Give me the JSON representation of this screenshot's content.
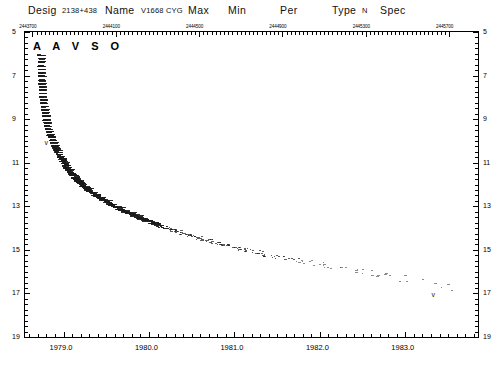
{
  "header": {
    "desig_label": "Desig",
    "desig_value": "2138+438",
    "name_label": "Name",
    "name_value": "V1668 CYG",
    "max_label": "Max",
    "max_value": "",
    "min_label": "Min",
    "min_value": "",
    "per_label": "Per",
    "per_value": "",
    "type_label": "Type",
    "type_value": "N",
    "spec_label": "Spec",
    "spec_value": ""
  },
  "watermark": "A A V S O",
  "chart_data": {
    "type": "scatter",
    "xlabel": "",
    "ylabel": "",
    "grid": false,
    "legend": null,
    "xlim": [
      1978.55,
      1983.85
    ],
    "ylim": [
      19,
      5
    ],
    "y_inverted": true,
    "x_top_axis": {
      "label": "Julian Date",
      "ticks": [
        2443700,
        2444100,
        2444500,
        2444900,
        2445300,
        2445700
      ],
      "tick_labels": [
        "2443700",
        "2444100",
        "2444500",
        "2444900",
        "2445300",
        "2445700"
      ],
      "minor_tick_step": 20
    },
    "x_bottom_axis": {
      "label": "Year",
      "ticks": [
        1979.0,
        1980.0,
        1981.0,
        1982.0,
        1983.0
      ],
      "tick_labels": [
        "1979.0",
        "1980.0",
        "1981.0",
        "1982.0",
        "1983.0"
      ],
      "minor_tick_step": 0.1
    },
    "y_left_axis": {
      "label": "Magnitude",
      "ticks": [
        5,
        7,
        9,
        11,
        13,
        15,
        17,
        19
      ],
      "tick_labels": [
        "5",
        "7",
        "9",
        "11",
        "13",
        "15",
        "17",
        "19"
      ],
      "minor_tick_step": 0.25
    },
    "y_right_axis": {
      "ticks": [
        5,
        7,
        9,
        11,
        13,
        15,
        17,
        19
      ],
      "tick_labels": [
        "5",
        "7",
        "9",
        "11",
        "13",
        "15",
        "17",
        "19"
      ]
    },
    "series": [
      {
        "name": "visual magnitude estimates",
        "marker": "dash",
        "color": "#1a1a1a",
        "points": [
          [
            1978.7,
            6.05
          ],
          [
            1978.702,
            6.2
          ],
          [
            1978.704,
            6.35
          ],
          [
            1978.703,
            6.55
          ],
          [
            1978.706,
            6.7
          ],
          [
            1978.708,
            6.85
          ],
          [
            1978.71,
            7.0
          ],
          [
            1978.712,
            7.2
          ],
          [
            1978.714,
            7.35
          ],
          [
            1978.716,
            7.5
          ],
          [
            1978.718,
            7.65
          ],
          [
            1978.722,
            7.8
          ],
          [
            1978.726,
            7.95
          ],
          [
            1978.73,
            8.1
          ],
          [
            1978.735,
            8.25
          ],
          [
            1978.74,
            8.4
          ],
          [
            1978.746,
            8.55
          ],
          [
            1978.752,
            8.7
          ],
          [
            1978.758,
            8.85
          ],
          [
            1978.764,
            9.0
          ],
          [
            1978.772,
            9.15
          ],
          [
            1978.78,
            9.3
          ],
          [
            1978.79,
            9.45
          ],
          [
            1978.8,
            9.55
          ],
          [
            1978.812,
            9.7
          ],
          [
            1978.824,
            9.8
          ],
          [
            1978.836,
            9.95
          ],
          [
            1978.85,
            10.05
          ],
          [
            1978.864,
            10.2
          ],
          [
            1978.878,
            10.3
          ],
          [
            1978.892,
            10.4
          ],
          [
            1978.906,
            10.5
          ],
          [
            1978.92,
            10.6
          ],
          [
            1978.935,
            10.7
          ],
          [
            1978.95,
            10.8
          ],
          [
            1978.965,
            10.9
          ],
          [
            1978.98,
            11.0
          ],
          [
            1978.995,
            11.1
          ],
          [
            1979.012,
            11.2
          ],
          [
            1979.03,
            11.3
          ],
          [
            1979.048,
            11.4
          ],
          [
            1979.066,
            11.5
          ],
          [
            1979.084,
            11.55
          ],
          [
            1979.102,
            11.65
          ],
          [
            1979.12,
            11.72
          ],
          [
            1979.14,
            11.8
          ],
          [
            1979.16,
            11.88
          ],
          [
            1979.18,
            11.95
          ],
          [
            1979.205,
            12.05
          ],
          [
            1979.23,
            12.12
          ],
          [
            1979.255,
            12.2
          ],
          [
            1979.28,
            12.28
          ],
          [
            1979.31,
            12.35
          ],
          [
            1979.34,
            12.45
          ],
          [
            1979.37,
            12.52
          ],
          [
            1979.4,
            12.6
          ],
          [
            1979.435,
            12.68
          ],
          [
            1979.47,
            12.76
          ],
          [
            1979.505,
            12.85
          ],
          [
            1979.54,
            12.92
          ],
          [
            1979.58,
            13.0
          ],
          [
            1979.62,
            13.08
          ],
          [
            1979.66,
            13.15
          ],
          [
            1979.7,
            13.22
          ],
          [
            1979.745,
            13.3
          ],
          [
            1979.79,
            13.38
          ],
          [
            1979.835,
            13.45
          ],
          [
            1979.88,
            13.52
          ],
          [
            1979.925,
            13.6
          ],
          [
            1979.97,
            13.66
          ],
          [
            1980.02,
            13.74
          ],
          [
            1980.07,
            13.8
          ],
          [
            1980.12,
            13.88
          ],
          [
            1980.17,
            13.95
          ],
          [
            1980.225,
            14.02
          ],
          [
            1980.28,
            14.08
          ],
          [
            1980.335,
            14.15
          ],
          [
            1980.39,
            14.22
          ],
          [
            1980.45,
            14.3
          ],
          [
            1980.51,
            14.36
          ],
          [
            1980.57,
            14.42
          ],
          [
            1980.63,
            14.5
          ],
          [
            1980.695,
            14.56
          ],
          [
            1980.76,
            14.62
          ],
          [
            1980.825,
            14.7
          ],
          [
            1980.89,
            14.76
          ],
          [
            1980.955,
            14.82
          ],
          [
            1981.02,
            14.9
          ],
          [
            1981.09,
            14.96
          ],
          [
            1981.16,
            15.02
          ],
          [
            1981.23,
            15.08
          ],
          [
            1981.3,
            15.14
          ],
          [
            1981.375,
            15.2
          ],
          [
            1981.45,
            15.26
          ],
          [
            1981.525,
            15.32
          ],
          [
            1981.6,
            15.38
          ],
          [
            1981.68,
            15.44
          ],
          [
            1981.76,
            15.5
          ],
          [
            1981.84,
            15.55
          ],
          [
            1981.92,
            15.6
          ],
          [
            1982.005,
            15.66
          ],
          [
            1982.09,
            15.72
          ],
          [
            1982.175,
            15.78
          ],
          [
            1982.26,
            15.84
          ],
          [
            1982.35,
            15.9
          ],
          [
            1982.44,
            15.96
          ],
          [
            1982.53,
            16.02
          ],
          [
            1982.62,
            16.08
          ],
          [
            1982.715,
            16.14
          ],
          [
            1982.81,
            16.2
          ],
          [
            1982.905,
            16.26
          ],
          [
            1983.0,
            16.32
          ],
          [
            1983.1,
            16.4
          ],
          [
            1983.2,
            16.48
          ],
          [
            1983.3,
            16.55
          ],
          [
            1983.4,
            16.62
          ],
          [
            1983.5,
            16.7
          ],
          [
            1983.6,
            16.78
          ]
        ]
      }
    ],
    "fainter_than_markers": [
      {
        "x": 1978.8,
        "y": 10.1,
        "symbol": "v"
      },
      {
        "x": 1983.33,
        "y": 17.05,
        "symbol": "v"
      }
    ],
    "annotations": [
      {
        "text": "A A V S O",
        "x": 1978.72,
        "y": 5.55
      }
    ]
  }
}
